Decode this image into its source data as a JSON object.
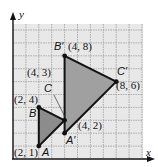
{
  "diagram": {
    "type": "coordinate-plane-transformation",
    "axes": {
      "x_label": "x",
      "y_label": "y"
    },
    "grid": {
      "x_min": 0,
      "x_max": 10,
      "y_min": 0,
      "y_max": 10,
      "step": 1
    },
    "colors": {
      "grid_bg": "#e8e8e8",
      "grid_line": "#9a9a9a",
      "original_fill": "#8c8c8c",
      "image_fill": "#a0a0a0",
      "stroke": "#111111"
    },
    "original_triangle": {
      "name": "ABC",
      "vertices": [
        {
          "label": "A",
          "coord_label": "(2, 1)",
          "x": 2,
          "y": 1
        },
        {
          "label": "B",
          "coord_label": "(2, 4)",
          "x": 2,
          "y": 4
        },
        {
          "label": "C",
          "coord_label": "(4, 3)",
          "x": 4,
          "y": 3
        }
      ]
    },
    "image_triangle": {
      "name": "A'B'C'",
      "vertices": [
        {
          "label": "A′",
          "coord_label": "(4, 2)",
          "x": 4,
          "y": 2
        },
        {
          "label": "B′",
          "coord_label": "(4, 8)",
          "x": 4,
          "y": 8
        },
        {
          "label": "C′",
          "coord_label": "(8, 6)",
          "x": 8,
          "y": 6
        }
      ]
    }
  }
}
